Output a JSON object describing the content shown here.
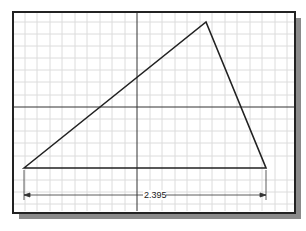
{
  "drawing": {
    "dimension_value": "2.395",
    "grid": true,
    "axes": {
      "vertical_x": 137,
      "horizontal_y": 107
    },
    "triangle": {
      "points": [
        [
          24,
          168
        ],
        [
          206,
          22
        ],
        [
          266,
          168
        ]
      ]
    },
    "colors": {
      "line": "#222222",
      "grid": "#dcdcdc",
      "shadow": "#8a8a8a"
    }
  }
}
